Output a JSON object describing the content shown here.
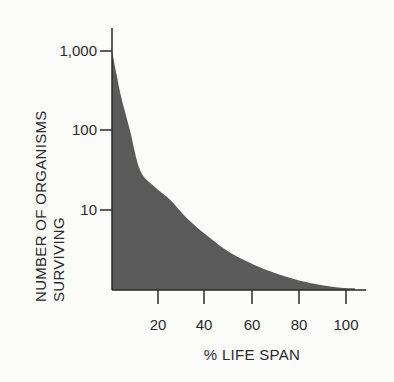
{
  "chart_data": {
    "type": "area",
    "title": "",
    "xlabel": "% LIFE SPAN",
    "ylabel_lines": [
      "NUMBER OF ORGANISMS",
      "SURVIVING"
    ],
    "ylabel": "NUMBER OF ORGANISMS SURVIVING",
    "x_ticks": [
      "20",
      "40",
      "60",
      "80",
      "100"
    ],
    "y_ticks": [
      "1,000",
      "100",
      "10"
    ],
    "y_scale": "log",
    "xlim": [
      0,
      108
    ],
    "ylim": [
      1,
      1000
    ],
    "grid": false,
    "legend": null,
    "fill_color": "#5a5a5a",
    "x": [
      0,
      2,
      4,
      7.7,
      12,
      18,
      25,
      32,
      40,
      48,
      55,
      62,
      68,
      75,
      81,
      90,
      98,
      104
    ],
    "values": [
      1000,
      500,
      260,
      100,
      32,
      20,
      13.5,
      8,
      5,
      3.3,
      2.5,
      2,
      1.7,
      1.45,
      1.3,
      1.15,
      1.07,
      1.05
    ]
  }
}
